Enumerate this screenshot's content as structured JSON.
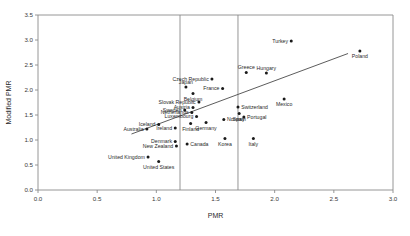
{
  "chart_data": {
    "type": "scatter",
    "title": "",
    "xlabel": "PMR",
    "ylabel": "Modified PMR",
    "xlim": [
      0.0,
      3.0
    ],
    "ylim": [
      0.0,
      3.5
    ],
    "xticks": [
      "0.0",
      "0.5",
      "1.0",
      "1.5",
      "2.0",
      "2.5",
      "3.0"
    ],
    "xtick_values": [
      0.0,
      0.5,
      1.0,
      1.5,
      2.0,
      2.5,
      3.0
    ],
    "yticks": [
      "0.0",
      "0.5",
      "1.0",
      "1.5",
      "2.0",
      "2.5",
      "3.0",
      "3.5"
    ],
    "ytick_values": [
      0.0,
      0.5,
      1.0,
      1.5,
      2.0,
      2.5,
      3.0,
      3.5
    ],
    "grid": false,
    "legend": "none",
    "reference_lines": {
      "vertical": [
        1.2,
        1.69
      ]
    },
    "trend_line": {
      "x_start": 0.79,
      "y_start": 1.12,
      "x_end": 2.62,
      "y_end": 2.73
    },
    "points": [
      {
        "label": "Turkey",
        "x": 2.14,
        "y": 2.98,
        "label_pos": "left"
      },
      {
        "label": "Poland",
        "x": 2.72,
        "y": 2.78,
        "label_pos": "below"
      },
      {
        "label": "Greece",
        "x": 1.76,
        "y": 2.35,
        "label_pos": "above"
      },
      {
        "label": "Hungary",
        "x": 1.93,
        "y": 2.34,
        "label_pos": "above"
      },
      {
        "label": "Czech Republic",
        "x": 1.47,
        "y": 2.22,
        "label_pos": "left"
      },
      {
        "label": "Japan",
        "x": 1.25,
        "y": 2.06,
        "label_pos": "above"
      },
      {
        "label": "France",
        "x": 1.56,
        "y": 2.03,
        "label_pos": "left"
      },
      {
        "label": "Belgium",
        "x": 1.31,
        "y": 1.93,
        "label_pos": "below"
      },
      {
        "label": "Mexico",
        "x": 2.08,
        "y": 1.82,
        "label_pos": "below"
      },
      {
        "label": "Slovak Republic",
        "x": 1.36,
        "y": 1.76,
        "label_pos": "left"
      },
      {
        "label": "Switzerland",
        "x": 1.69,
        "y": 1.66,
        "label_pos": "right"
      },
      {
        "label": "Austria",
        "x": 1.31,
        "y": 1.65,
        "label_pos": "left"
      },
      {
        "label": "Sweden",
        "x": 1.24,
        "y": 1.6,
        "label_pos": "left"
      },
      {
        "label": "Netherlands",
        "x": 1.3,
        "y": 1.55,
        "label_pos": "left"
      },
      {
        "label": "Spain",
        "x": 1.7,
        "y": 1.53,
        "label_pos": "below"
      },
      {
        "label": "Portugal",
        "x": 1.74,
        "y": 1.46,
        "label_pos": "right"
      },
      {
        "label": "Luxembourg",
        "x": 1.34,
        "y": 1.47,
        "label_pos": "left"
      },
      {
        "label": "Norway",
        "x": 1.57,
        "y": 1.41,
        "label_pos": "right"
      },
      {
        "label": "Germany",
        "x": 1.42,
        "y": 1.35,
        "label_pos": "below"
      },
      {
        "label": "Finland",
        "x": 1.29,
        "y": 1.33,
        "label_pos": "below"
      },
      {
        "label": "Iceland",
        "x": 1.02,
        "y": 1.31,
        "label_pos": "left"
      },
      {
        "label": "Ireland",
        "x": 1.16,
        "y": 1.24,
        "label_pos": "left"
      },
      {
        "label": "Australia",
        "x": 0.92,
        "y": 1.22,
        "label_pos": "left"
      },
      {
        "label": "Italy",
        "x": 1.82,
        "y": 1.03,
        "label_pos": "below"
      },
      {
        "label": "Korea",
        "x": 1.58,
        "y": 1.03,
        "label_pos": "below"
      },
      {
        "label": "Denmark",
        "x": 1.16,
        "y": 0.97,
        "label_pos": "left"
      },
      {
        "label": "Canada",
        "x": 1.26,
        "y": 0.92,
        "label_pos": "right"
      },
      {
        "label": "New Zealand",
        "x": 1.17,
        "y": 0.88,
        "label_pos": "left"
      },
      {
        "label": "United Kingdom",
        "x": 0.93,
        "y": 0.66,
        "label_pos": "left"
      },
      {
        "label": "United States",
        "x": 1.02,
        "y": 0.57,
        "label_pos": "below"
      }
    ]
  }
}
